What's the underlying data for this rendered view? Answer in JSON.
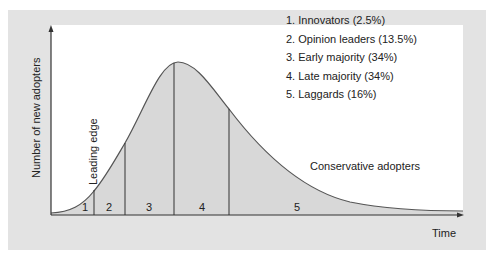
{
  "axes": {
    "y_label": "Number of new adopters",
    "x_label": "Time"
  },
  "legend": [
    {
      "label": "1. Innovators (2.5%)"
    },
    {
      "label": "2. Opinion leaders (13.5%)"
    },
    {
      "label": "3. Early majority (34%)"
    },
    {
      "label": "4. Late majority (34%)"
    },
    {
      "label": "5. Laggards (16%)"
    }
  ],
  "segments": [
    {
      "number": "1",
      "name": "Innovators",
      "share_pct": 2.5
    },
    {
      "number": "2",
      "name": "Opinion leaders",
      "share_pct": 13.5
    },
    {
      "number": "3",
      "name": "Early majority",
      "share_pct": 34
    },
    {
      "number": "4",
      "name": "Late majority",
      "share_pct": 34
    },
    {
      "number": "5",
      "name": "Laggards",
      "share_pct": 16
    }
  ],
  "annotations": {
    "leading_edge": "Leading edge",
    "conservative": "Conservative adopters"
  },
  "colors": {
    "panel": "#e3e3e3",
    "plot_bg": "#ffffff",
    "fill": "#d8d8d8",
    "line": "#333333"
  }
}
